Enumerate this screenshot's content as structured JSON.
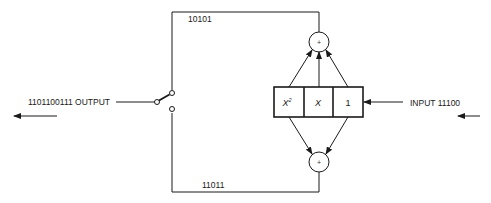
{
  "diagram": {
    "output": {
      "label": "1101100111 OUTPUT"
    },
    "input": {
      "label": "INPUT 11100"
    },
    "upper_path": {
      "label": "10101"
    },
    "lower_path": {
      "label": "11011"
    },
    "register": {
      "cells": [
        {
          "label": "X",
          "superscript": "2"
        },
        {
          "label": "X",
          "superscript": ""
        },
        {
          "label": "1",
          "superscript": ""
        }
      ]
    },
    "adders": [
      {
        "name": "upper-adder",
        "symbol": "+"
      },
      {
        "name": "lower-adder",
        "symbol": "+"
      }
    ],
    "colors": {
      "line": "#1a1a1a",
      "background": "#ffffff"
    }
  }
}
